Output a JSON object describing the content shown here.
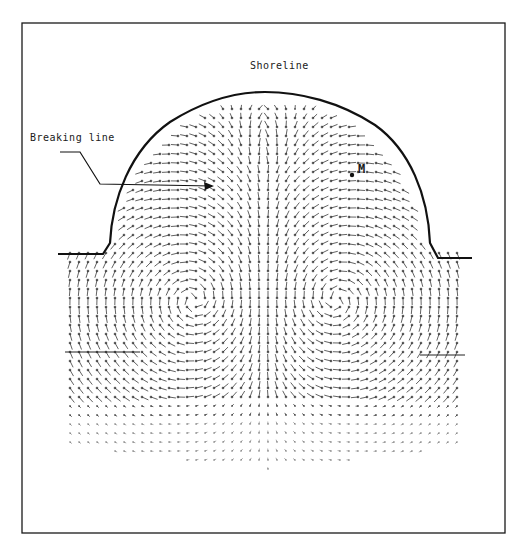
{
  "figure": {
    "type": "velocity vector field in semicircular bay",
    "labels": {
      "shoreline": "Shoreline",
      "breaking_line": "Breaking line",
      "point": "M"
    },
    "colors": {
      "ink": "#1a1a1a",
      "vectors": "#333333",
      "background": "#ffffff"
    },
    "frame": {
      "left": 22,
      "top": 23,
      "right": 505,
      "bottom": 533
    },
    "shoreline_path": "M58,254 L103,254 L110,243 C112,200 130,150 170,122 C205,100 235,92 265,92 C300,92 340,102 375,125 C410,150 428,195 430,243 L438,258 L472,258",
    "point_m": {
      "x": 352,
      "y": 175
    },
    "breaking_line_left": {
      "x1": 65,
      "x2": 140,
      "y": 352
    },
    "breaking_line_right": {
      "x1": 420,
      "x2": 465,
      "y": 355
    },
    "vector_grid": {
      "x_start": 70,
      "x_end": 465,
      "dx": 9,
      "y_start": 100,
      "y_end": 475,
      "dy": 9,
      "vortices": [
        {
          "cx": 195,
          "cy": 300,
          "sense": "ccw"
        },
        {
          "cx": 335,
          "cy": 300,
          "sense": "cw"
        }
      ]
    }
  }
}
